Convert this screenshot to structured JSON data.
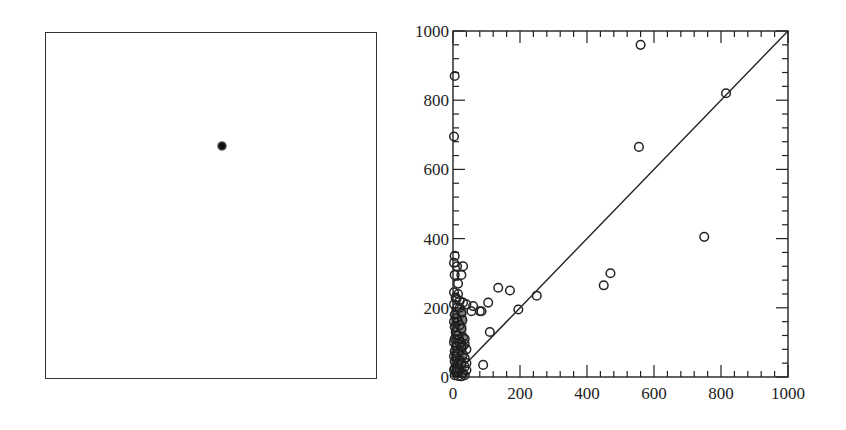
{
  "figure": {
    "left_panel": {
      "description": "Blank square frame with a single dark blurred point",
      "dot": {
        "x_frac": 0.53,
        "y_frac": 0.325
      }
    }
  },
  "chart_data": {
    "type": "scatter",
    "title": "",
    "xlabel": "",
    "ylabel": "",
    "xlim": [
      0,
      1000
    ],
    "ylim": [
      0,
      1000
    ],
    "x_ticks": [
      0,
      200,
      400,
      600,
      800,
      1000
    ],
    "y_ticks": [
      0,
      200,
      400,
      600,
      800,
      1000
    ],
    "x_tick_labels": [
      "0",
      "200",
      "400",
      "600",
      "800",
      "1000"
    ],
    "y_tick_labels": [
      "0",
      "200",
      "400",
      "600",
      "800",
      "1000"
    ],
    "minor_tick_step": 40,
    "grid": false,
    "legend": null,
    "marker": "open-circle",
    "reference_line": {
      "type": "identity",
      "x": [
        0,
        1000
      ],
      "y": [
        0,
        1000
      ]
    },
    "series": [
      {
        "name": "points",
        "points": [
          [
            5,
            870
          ],
          [
            3,
            695
          ],
          [
            560,
            960
          ],
          [
            815,
            820
          ],
          [
            555,
            665
          ],
          [
            750,
            405
          ],
          [
            470,
            300
          ],
          [
            450,
            265
          ],
          [
            250,
            235
          ],
          [
            195,
            195
          ],
          [
            170,
            250
          ],
          [
            135,
            258
          ],
          [
            105,
            215
          ],
          [
            110,
            130
          ],
          [
            90,
            35
          ],
          [
            85,
            190
          ],
          [
            80,
            190
          ],
          [
            55,
            190
          ],
          [
            60,
            205
          ],
          [
            40,
            210
          ],
          [
            30,
            215
          ],
          [
            20,
            220
          ],
          [
            10,
            225
          ],
          [
            5,
            350
          ],
          [
            3,
            330
          ],
          [
            12,
            320
          ],
          [
            30,
            320
          ],
          [
            25,
            295
          ],
          [
            5,
            295
          ],
          [
            15,
            270
          ],
          [
            3,
            245
          ],
          [
            15,
            240
          ],
          [
            8,
            230
          ],
          [
            3,
            210
          ],
          [
            20,
            200
          ],
          [
            25,
            185
          ],
          [
            5,
            180
          ],
          [
            10,
            170
          ],
          [
            15,
            160
          ],
          [
            20,
            150
          ],
          [
            5,
            145
          ],
          [
            25,
            140
          ],
          [
            8,
            130
          ],
          [
            15,
            120
          ],
          [
            30,
            115
          ],
          [
            35,
            110
          ],
          [
            5,
            110
          ],
          [
            20,
            100
          ],
          [
            35,
            95
          ],
          [
            10,
            90
          ],
          [
            25,
            85
          ],
          [
            40,
            80
          ],
          [
            5,
            75
          ],
          [
            15,
            70
          ],
          [
            30,
            65
          ],
          [
            10,
            60
          ],
          [
            35,
            55
          ],
          [
            20,
            50
          ],
          [
            5,
            45
          ],
          [
            25,
            40
          ],
          [
            15,
            35
          ],
          [
            35,
            30
          ],
          [
            5,
            25
          ],
          [
            20,
            20
          ],
          [
            10,
            15
          ],
          [
            30,
            10
          ],
          [
            5,
            5
          ],
          [
            15,
            3
          ],
          [
            25,
            2
          ],
          [
            35,
            5
          ],
          [
            3,
            160
          ],
          [
            3,
            100
          ],
          [
            3,
            60
          ],
          [
            3,
            20
          ],
          [
            40,
            20
          ],
          [
            40,
            40
          ],
          [
            30,
            90
          ],
          [
            18,
            110
          ],
          [
            12,
            200
          ],
          [
            28,
            165
          ]
        ]
      }
    ]
  }
}
